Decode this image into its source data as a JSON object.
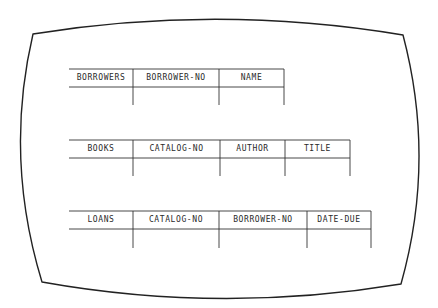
{
  "screen": {
    "stroke_color": "#222222",
    "background": "#ffffff"
  },
  "tables": [
    {
      "name": "BORROWERS",
      "columns": [
        "BORROWER-NO",
        "NAME"
      ]
    },
    {
      "name": "BOOKS",
      "columns": [
        "CATALOG-NO",
        "AUTHOR",
        "TITLE"
      ]
    },
    {
      "name": "LOANS",
      "columns": [
        "CATALOG-NO",
        "BORROWER-NO",
        "DATE-DUE"
      ]
    }
  ]
}
